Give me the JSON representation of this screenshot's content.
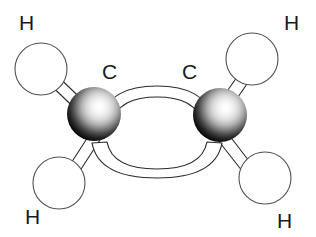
{
  "figure": {
    "name": "ethylene-ball-and-stick-model",
    "background_color": "#ffffff",
    "width": 316,
    "height": 237
  },
  "colors": {
    "carbon_sphere_dark": "#000000",
    "carbon_sphere_highlight": "#ffffff",
    "hydrogen_fill": "#ffffff",
    "hydrogen_outline": "#55504e",
    "bond_fill": "#ffffff",
    "bond_outline": "#2b2b2b",
    "label_color": "#1a1a1a"
  },
  "labels": {
    "h_top_left": "H",
    "h_top_right": "H",
    "h_bottom_left": "H",
    "h_bottom_right": "H",
    "c_left": "C",
    "c_right": "C"
  },
  "molecule": {
    "formula": "C2H4",
    "name": "Ethylene",
    "atoms": [
      {
        "id": "C1",
        "element": "C",
        "label": "C",
        "cx": 94,
        "cy": 114,
        "r": 27,
        "style": "shaded-sphere"
      },
      {
        "id": "C2",
        "element": "C",
        "label": "C",
        "cx": 220,
        "cy": 115,
        "r": 27,
        "style": "shaded-sphere"
      },
      {
        "id": "H1",
        "element": "H",
        "label": "H",
        "cx": 41,
        "cy": 69,
        "r": 26,
        "style": "outline-circle"
      },
      {
        "id": "H2",
        "element": "H",
        "label": "H",
        "cx": 252,
        "cy": 59,
        "r": 26,
        "style": "outline-circle"
      },
      {
        "id": "H3",
        "element": "H",
        "label": "H",
        "cx": 59,
        "cy": 183,
        "r": 26,
        "style": "outline-circle"
      },
      {
        "id": "H4",
        "element": "H",
        "label": "H",
        "cx": 265,
        "cy": 178,
        "r": 26,
        "style": "outline-circle"
      }
    ],
    "bonds": [
      {
        "id": "C1-H1",
        "from": "C1",
        "to": "H1",
        "order": 1,
        "shape": "straight-tube"
      },
      {
        "id": "C1-H3",
        "from": "C1",
        "to": "H3",
        "order": 1,
        "shape": "straight-tube"
      },
      {
        "id": "C2-H2",
        "from": "C2",
        "to": "H2",
        "order": 1,
        "shape": "straight-tube"
      },
      {
        "id": "C2-H4",
        "from": "C2",
        "to": "H4",
        "order": 1,
        "shape": "straight-tube"
      },
      {
        "id": "C1=C2-upper",
        "from": "C1",
        "to": "C2",
        "order": 2,
        "shape": "bent-banana-bond-up"
      },
      {
        "id": "C1=C2-lower",
        "from": "C1",
        "to": "C2",
        "order": 2,
        "shape": "bent-banana-bond-down"
      }
    ]
  },
  "label_positions": {
    "h_top_left": {
      "x": 19,
      "y": 12
    },
    "h_top_right": {
      "x": 284,
      "y": 12
    },
    "h_bottom_left": {
      "x": 25,
      "y": 206
    },
    "h_bottom_right": {
      "x": 277,
      "y": 210
    },
    "c_left": {
      "x": 102,
      "y": 61
    },
    "c_right": {
      "x": 182,
      "y": 61
    }
  }
}
